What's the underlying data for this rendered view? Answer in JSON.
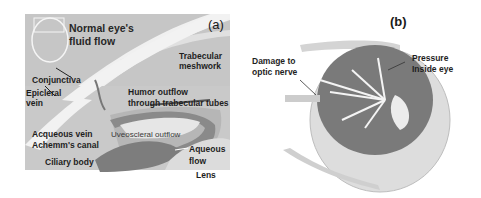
{
  "figure": {
    "panel_a": {
      "tag": "(a)",
      "title_line1": "Normal eye's",
      "title_line2": "fluid flow",
      "labels": {
        "trabecular_line1": "Trabecular",
        "trabecular_line2": "meshwork",
        "conjunctiva": "Conjunctiva",
        "episcleral_line1": "Epicleral",
        "episcleral_line2": "vein",
        "humor_line1": "Humor outflow",
        "humor_line2": "through trabecular tubes",
        "aqueous_vein": "Acqueous vein",
        "schlemm": "Achemm's canal",
        "uveoscleral": "Uveoscleral outflow",
        "ciliary": "Ciliary body",
        "aqueous_flow_line1": "Aqueous",
        "aqueous_flow_line2": "flow",
        "lens": "Lens"
      }
    },
    "panel_b": {
      "tag": "(b)",
      "labels": {
        "damage_line1": "Damage to",
        "damage_line2": "optic nerve",
        "pressure_line1": "Pressure",
        "pressure_line2": "Inside eye"
      }
    },
    "colors": {
      "background": "#ffffff",
      "panel_a_bg": "#c9c9c9",
      "cornea": "#eeeeee",
      "dark_tissue": "#6e6e6e",
      "eye_interior": "#7a7a7a",
      "arrows": "#f4f4f4"
    }
  }
}
